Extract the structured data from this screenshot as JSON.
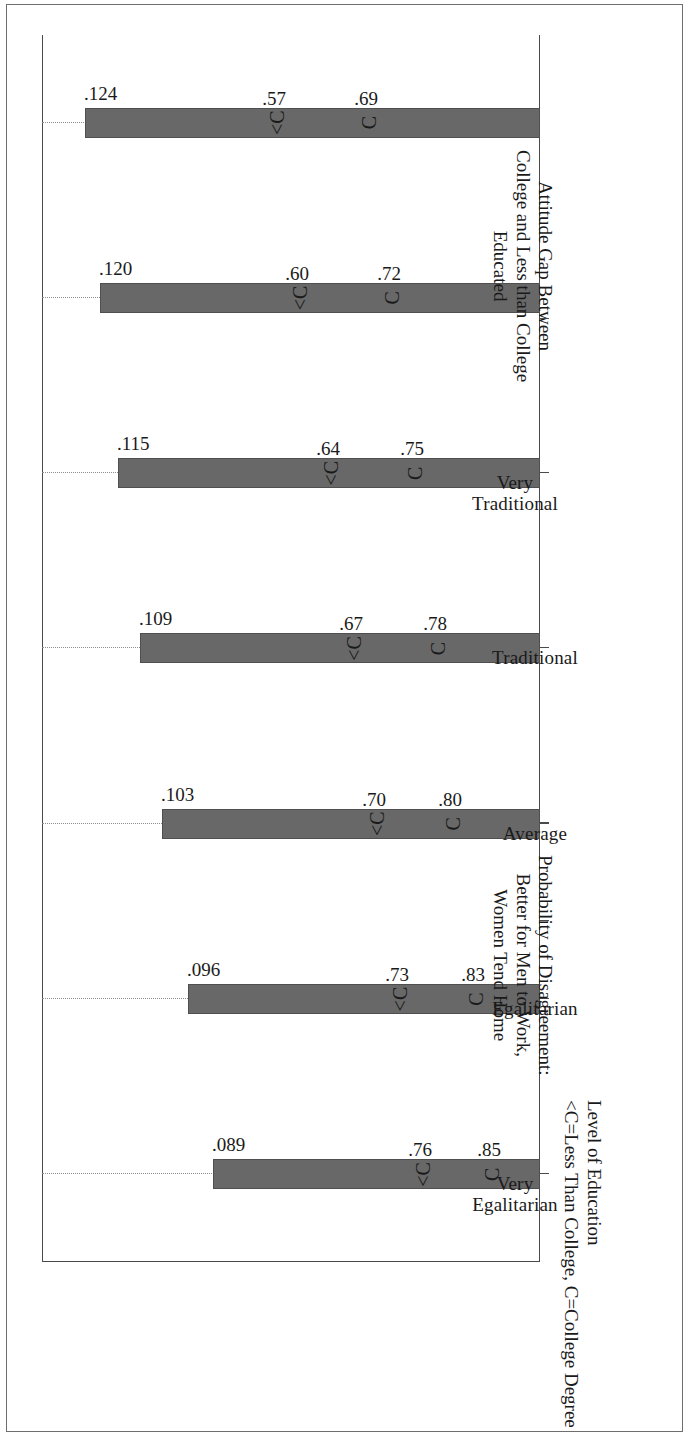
{
  "figure": {
    "bar_axis_title": "Attitude Gap Between\nCollege and Less than College\nEducated",
    "bar_axis_title_lines": [
      "Attitude Gap Between",
      "College and Less than College",
      "Educated"
    ],
    "prob_axis_title_lines": [
      "Probability of Disagreement:",
      "Better for Men to Work,",
      "Women Tend Home"
    ],
    "footnote_lines": [
      "Level of Education",
      "<C=Less Than College, C=College Degree"
    ],
    "bar_color": "#686868",
    "grid_color": "#8c8c8c",
    "axis_color": "#4a4a4a"
  },
  "chart_data": {
    "type": "bar",
    "title": "",
    "xlabel": "Level of Education",
    "ylabel": "Attitude Gap Between College and Less than College Educated",
    "categories": [
      "Very Egalitarian",
      "Egalitarian",
      "Average",
      "Traditional",
      "Very Traditional",
      "",
      ""
    ],
    "category_labels_shown": [
      [
        "Very",
        "Egalitarian"
      ],
      [
        "Egalitarian"
      ],
      [
        "Average"
      ],
      [
        "Traditional"
      ],
      [
        "Very",
        "Traditional"
      ]
    ],
    "category_label_at_index": [
      0,
      1,
      2,
      3,
      4
    ],
    "bar_values": [
      0.089,
      0.096,
      0.103,
      0.109,
      0.115,
      0.12,
      0.124
    ],
    "bar_value_labels": [
      ".089",
      ".096",
      ".103",
      ".109",
      ".115",
      ".120",
      ".124"
    ],
    "ylim_bars": [
      0,
      0.135
    ],
    "series": [
      {
        "name": "C=College Degree",
        "marker": "C",
        "values": [
          0.85,
          0.83,
          0.8,
          0.78,
          0.75,
          0.72,
          0.69
        ],
        "value_labels": [
          ".85",
          ".83",
          ".80",
          ".78",
          ".75",
          ".72",
          ".69"
        ]
      },
      {
        "name": "<C=Less Than College",
        "marker": "<C",
        "values": [
          0.76,
          0.73,
          0.7,
          0.67,
          0.64,
          0.6,
          0.57
        ],
        "value_labels": [
          ".76",
          ".73",
          ".70",
          ".67",
          ".64",
          ".60",
          ".57"
        ]
      }
    ],
    "ylim_prob": [
      0.5,
      0.9
    ],
    "grid": "dotted vertical gridlines at each category",
    "legend": "inline marker glyphs: C = College Degree, <C = Less Than College"
  }
}
